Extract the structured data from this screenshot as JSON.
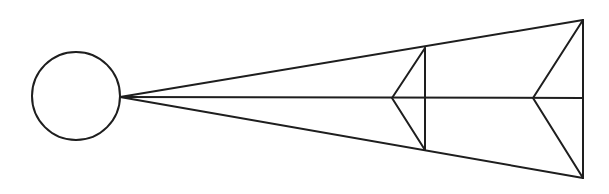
{
  "diagram": {
    "type": "line-drawing",
    "stroke_color": "#1e1e1e",
    "background": "#ffffff",
    "circle": {
      "cx": 76,
      "cy": 96,
      "r": 44
    },
    "apex": {
      "x": 120,
      "y": 97
    },
    "rays": [
      {
        "name": "top-ray",
        "x2": 583,
        "y2": 20
      },
      {
        "name": "center-ray",
        "x2": 583,
        "y2": 98
      },
      {
        "name": "bottom-ray",
        "x2": 583,
        "y2": 178
      }
    ],
    "planes": [
      {
        "name": "near-plane",
        "x": 425,
        "y1": 48,
        "y2": 150,
        "arrow_tip_x": 392,
        "arrow_tip_y": 98
      },
      {
        "name": "far-plane",
        "x": 583,
        "y1": 20,
        "y2": 178,
        "arrow_tip_x": 533,
        "arrow_tip_y": 98
      }
    ]
  }
}
